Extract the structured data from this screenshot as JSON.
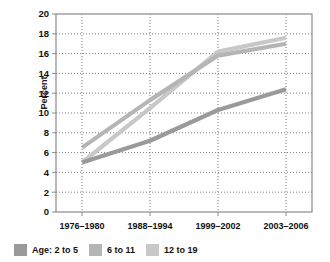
{
  "chart_data": {
    "type": "line",
    "title": "",
    "xlabel": "",
    "ylabel": "Percent",
    "categories": [
      "1976–1980",
      "1988–1994",
      "1999–2002",
      "2003–2006"
    ],
    "ylim": [
      0,
      20
    ],
    "ytick_step": 2,
    "yticks": [
      "0",
      "2",
      "4",
      "6",
      "8",
      "10",
      "12",
      "14",
      "16",
      "18",
      "20"
    ],
    "grid": "both-dotted",
    "legend_position": "bottom-left",
    "series": [
      {
        "name": "Age: 2 to 5",
        "color": "#9a9a9a",
        "values": [
          5.0,
          7.2,
          10.3,
          12.4
        ]
      },
      {
        "name": "6 to 11",
        "color": "#b5b5b5",
        "values": [
          6.5,
          11.3,
          15.8,
          17.0
        ]
      },
      {
        "name": "12 to 19",
        "color": "#c8c8c8",
        "values": [
          5.0,
          10.5,
          16.2,
          17.6
        ]
      }
    ]
  },
  "axis": {
    "y_title": "Percent"
  },
  "legend": {
    "items": [
      {
        "label": "Age: 2 to 5",
        "color": "#9a9a9a"
      },
      {
        "label": "6 to 11",
        "color": "#b5b5b5"
      },
      {
        "label": "12 to 19",
        "color": "#c8c8c8"
      }
    ]
  },
  "colors": {
    "frame": "#8a8a8a",
    "grid": "#6e6e6e",
    "text": "#111111",
    "background": "#ffffff"
  }
}
